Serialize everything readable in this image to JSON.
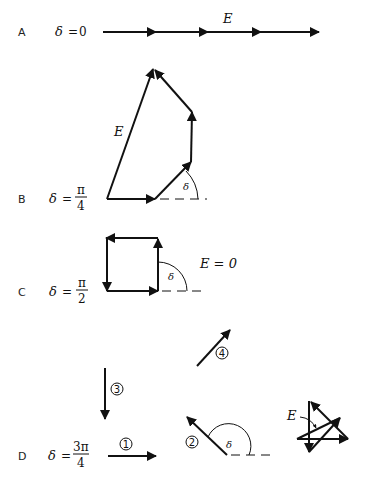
{
  "figure": {
    "panels": [
      {
        "id": "A",
        "label": "A",
        "delta_symbol": "δ",
        "equals": "=",
        "delta_value": "0",
        "resultant_label": "E",
        "description": "Four collinear phasors head-to-tail along horizontal line"
      },
      {
        "id": "B",
        "label": "B",
        "delta_symbol": "δ",
        "equals": "=",
        "delta_numerator": "π",
        "delta_denominator": "4",
        "resultant_label": "E",
        "angle_label": "δ",
        "description": "Four phasors each rotated by π/4; resultant E closes polygon"
      },
      {
        "id": "C",
        "label": "C",
        "delta_symbol": "δ",
        "equals": "=",
        "delta_numerator": "π",
        "delta_denominator": "2",
        "angle_label": "δ",
        "resultant_text": "E = 0",
        "description": "Four phasors form a closed square; resultant zero"
      },
      {
        "id": "D",
        "label": "D",
        "delta_symbol": "δ",
        "equals": "=",
        "delta_numerator": "3π",
        "delta_denominator": "4",
        "angle_label": "δ",
        "resultant_label": "E",
        "vectors": [
          {
            "number": "1",
            "direction": "0"
          },
          {
            "number": "2",
            "direction": "3π/4"
          },
          {
            "number": "3",
            "direction": "3π/2"
          },
          {
            "number": "4",
            "direction": "9π/4"
          }
        ],
        "description": "Individual phasors 1–4 and their head-to-tail sum forming a star with small resultant E"
      }
    ]
  }
}
